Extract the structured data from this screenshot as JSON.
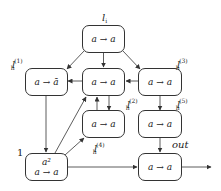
{
  "diagram": {
    "type": "flow-graph",
    "nodes": [
      {
        "id": "li",
        "label": "l",
        "label_sub": "i",
        "label_sup": "",
        "text": "a → a",
        "text_top": ""
      },
      {
        "id": "lh1",
        "label": "l",
        "label_sub": "h",
        "label_sup": "(1)",
        "text": "a → ā",
        "text_top": ""
      },
      {
        "id": "lh2",
        "label": "l",
        "label_sub": "h",
        "label_sup": "(2)",
        "text": "a → a",
        "text_top": ""
      },
      {
        "id": "lh3",
        "label": "l",
        "label_sub": "h",
        "label_sup": "(3)",
        "text": "a → a",
        "text_top": ""
      },
      {
        "id": "lh4",
        "label": "l",
        "label_sub": "h",
        "label_sup": "(4)",
        "text": "a → a",
        "text_top": ""
      },
      {
        "id": "lh5",
        "label": "l",
        "label_sub": "h",
        "label_sup": "(5)",
        "text": "a → a",
        "text_top": ""
      },
      {
        "id": "one",
        "label": "1",
        "label_sub": "",
        "label_sup": "",
        "text": "a → a",
        "text_top": "a²"
      },
      {
        "id": "out",
        "label": "out",
        "label_sub": "",
        "label_sup": "",
        "text": "a → a",
        "text_top": ""
      }
    ],
    "edges": [
      {
        "from": "li",
        "to": "lh1"
      },
      {
        "from": "li",
        "to": "lh2"
      },
      {
        "from": "li",
        "to": "lh3"
      },
      {
        "from": "lh2",
        "to": "lh1"
      },
      {
        "from": "lh3",
        "to": "lh2"
      },
      {
        "from": "lh3",
        "to": "lh5"
      },
      {
        "from": "lh2",
        "to": "lh4"
      },
      {
        "from": "lh4",
        "to": "lh2"
      },
      {
        "from": "lh1",
        "to": "one"
      },
      {
        "from": "one",
        "to": "lh2"
      },
      {
        "from": "one",
        "to": "lh4"
      },
      {
        "from": "one",
        "to": "out"
      },
      {
        "from": "lh5",
        "to": "out"
      },
      {
        "from": "out",
        "to": "exit"
      }
    ]
  }
}
